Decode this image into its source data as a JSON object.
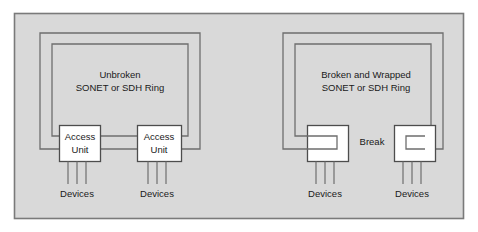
{
  "figure": {
    "background_color": "#d9d9d9",
    "panel_border_color": "#7a7a7a",
    "line_color": "#6e6e6e",
    "box_fill": "#ffffff",
    "box_border_color": "#4d4d4d",
    "text_color": "#1a1a1a"
  },
  "left_panel": {
    "name": "unbroken-ring-panel",
    "title_line1": "Unbroken",
    "title_line2": "SONET or SDH  Ring",
    "access_units": [
      {
        "line1": "Access",
        "line2": "Unit"
      },
      {
        "line1": "Access",
        "line2": "Unit"
      }
    ],
    "device_labels": [
      "Devices",
      "Devices"
    ]
  },
  "right_panel": {
    "name": "broken-wrapped-ring-panel",
    "title_line1": "Broken and Wrapped",
    "title_line2": "SONET or SDH  Ring",
    "break_label": "Break",
    "wrapped_units": [
      {
        "line1": "",
        "line2": ""
      },
      {
        "line1": "",
        "line2": ""
      }
    ],
    "device_labels": [
      "Devices",
      "Devices"
    ]
  }
}
